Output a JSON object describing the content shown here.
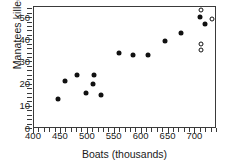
{
  "chart_data": {
    "type": "scatter",
    "title": "",
    "xlabel": "Boats (thousands)",
    "ylabel": "Manatees killed",
    "xlim": [
      400,
      740
    ],
    "ylim": [
      0,
      55
    ],
    "xticks": [
      400,
      450,
      500,
      550,
      600,
      650,
      700
    ],
    "yticks": [
      0,
      10,
      20,
      30,
      40,
      50
    ],
    "xtick_labels": [
      "400",
      "450",
      "500",
      "550",
      "600",
      "650",
      "700"
    ],
    "ytick_labels": [
      "0",
      "10",
      "20",
      "30",
      "40",
      "50"
    ],
    "minor_tick_step_x": 10,
    "minor_tick_step_y": 2,
    "grid": false,
    "legend": null,
    "series": [
      {
        "name": "observed",
        "marker": "filled",
        "points": [
          {
            "x": 447,
            "y": 13
          },
          {
            "x": 460,
            "y": 21
          },
          {
            "x": 481,
            "y": 24
          },
          {
            "x": 498,
            "y": 16
          },
          {
            "x": 513,
            "y": 24
          },
          {
            "x": 512,
            "y": 20
          },
          {
            "x": 526,
            "y": 15
          },
          {
            "x": 559,
            "y": 34
          },
          {
            "x": 585,
            "y": 33
          },
          {
            "x": 614,
            "y": 33
          },
          {
            "x": 645,
            "y": 39
          },
          {
            "x": 675,
            "y": 43
          },
          {
            "x": 711,
            "y": 50
          },
          {
            "x": 719,
            "y": 47
          }
        ]
      },
      {
        "name": "other",
        "marker": "open",
        "points": [
          {
            "x": 712,
            "y": 53
          },
          {
            "x": 732,
            "y": 49
          },
          {
            "x": 713,
            "y": 38
          },
          {
            "x": 713,
            "y": 35
          }
        ]
      }
    ]
  },
  "colors": {
    "axis": "#3a3a3a",
    "marker_filled": "#111111",
    "marker_open_fill": "#ffffff",
    "background": "#ffffff"
  }
}
